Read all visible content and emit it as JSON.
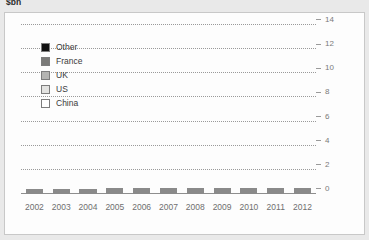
{
  "chart_data": {
    "type": "bar",
    "stacked": true,
    "title": "$bn",
    "xlabel": "",
    "ylabel": "",
    "ylim": [
      0,
      14
    ],
    "yticks": [
      0,
      2,
      4,
      6,
      8,
      10,
      12,
      14
    ],
    "grid": true,
    "y_axis_position": "right",
    "legend_position": "top-left",
    "categories": [
      "2002",
      "2003",
      "2004",
      "2005",
      "2006",
      "2007",
      "2008",
      "2009",
      "2010",
      "2011",
      "2012"
    ],
    "series": [
      {
        "name": "China",
        "color": "#ffffff",
        "values": [
          0.9,
          0.9,
          1.0,
          1.3,
          0.3,
          0.7,
          0.5,
          0.7,
          3.1,
          4.7,
          5.0
        ]
      },
      {
        "name": "US",
        "color": "#e3e3e1",
        "values": [
          0.6,
          0.5,
          0.5,
          0.9,
          4.2,
          3.7,
          3.2,
          0.9,
          2.9,
          2.9,
          3.2
        ]
      },
      {
        "name": "UK",
        "color": "#b4b4b2",
        "values": [
          0.1,
          0.1,
          0.3,
          0.5,
          0.7,
          2.9,
          3.0,
          0.7,
          2.0,
          2.4,
          2.2
        ]
      },
      {
        "name": "France",
        "color": "#7a7a78",
        "values": [
          0.0,
          0.0,
          0.0,
          0.2,
          0.3,
          0.6,
          0.4,
          0.9,
          0.4,
          0.3,
          0.6
        ]
      },
      {
        "name": "Other",
        "color": "#111111",
        "values": [
          0.8,
          0.7,
          0.8,
          1.2,
          0.8,
          1.4,
          1.1,
          1.3,
          1.1,
          1.4,
          1.2
        ]
      }
    ],
    "totals": [
      2.4,
      2.2,
      2.6,
      4.1,
      6.3,
      9.3,
      8.2,
      4.5,
      9.5,
      11.7,
      12.2
    ]
  },
  "legend": {
    "items": [
      {
        "label": "Other",
        "color": "#111111"
      },
      {
        "label": "France",
        "color": "#7a7a78"
      },
      {
        "label": "UK",
        "color": "#b4b4b2"
      },
      {
        "label": "US",
        "color": "#e3e3e1"
      },
      {
        "label": "China",
        "color": "#ffffff"
      }
    ]
  }
}
